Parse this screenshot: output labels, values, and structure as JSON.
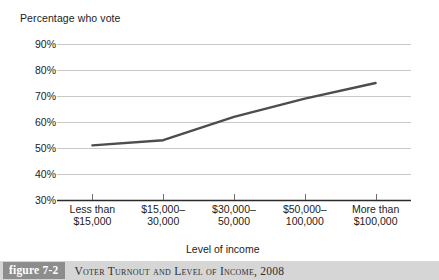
{
  "chart_data": {
    "type": "line",
    "title": "",
    "ylabel": "Percentage who vote",
    "xlabel": "Level of income",
    "categories": [
      "Less than\n$15,000",
      "$15,000–\n30,000",
      "$30,000–\n50,000",
      "$50,000–\n100,000",
      "More than\n$100,000"
    ],
    "category_lines": [
      [
        "Less than",
        "$15,000"
      ],
      [
        "$15,000–",
        "30,000"
      ],
      [
        "$30,000–",
        "50,000"
      ],
      [
        "$50,000–",
        "100,000"
      ],
      [
        "More than",
        "$100,000"
      ]
    ],
    "values": [
      51,
      53,
      62,
      69,
      75
    ],
    "ylim": [
      30,
      90
    ],
    "y_ticks": [
      90,
      80,
      70,
      60,
      50,
      40,
      30
    ],
    "y_tick_labels": [
      "90%",
      "80%",
      "70%",
      "60%",
      "50%",
      "40%",
      "30%"
    ],
    "grid": true,
    "legend": "none",
    "series_color": "#4d4d4d",
    "grid_color": "#c9c9c9",
    "axis_color": "#2b2b2b"
  },
  "caption": {
    "badge": "figure 7-2",
    "text": "Voter Turnout and Level of Income, 2008"
  }
}
